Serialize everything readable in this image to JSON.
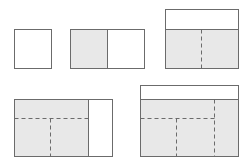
{
  "diagram": {
    "title": "",
    "colors": {
      "background": "#ffffff",
      "stroke": "#6b6b6b",
      "fill_shaded": "#e8e8e8",
      "fill_empty": "#ffffff",
      "dash_stroke": "#6b6b6b"
    },
    "figures": [
      {
        "id": "step-1",
        "outer": {
          "x": 14,
          "y": 29,
          "w": 37,
          "h": 39
        },
        "shaded": [],
        "solid_lines": [],
        "dashed_lines": []
      },
      {
        "id": "step-2",
        "outer": {
          "x": 70,
          "y": 29,
          "w": 74,
          "h": 39
        },
        "shaded": [
          {
            "x": 70,
            "y": 29,
            "w": 37,
            "h": 39
          }
        ],
        "solid_lines": [
          [
            107,
            29,
            107,
            68
          ]
        ],
        "dashed_lines": []
      },
      {
        "id": "step-3",
        "outer": {
          "x": 165,
          "y": 9,
          "w": 73,
          "h": 59
        },
        "shaded": [
          {
            "x": 165,
            "y": 29,
            "w": 73,
            "h": 39
          }
        ],
        "solid_lines": [
          [
            165,
            29,
            238,
            29
          ]
        ],
        "dashed_lines": [
          [
            201,
            29,
            201,
            68
          ]
        ]
      },
      {
        "id": "step-4",
        "outer": {
          "x": 14,
          "y": 99,
          "w": 98,
          "h": 57
        },
        "shaded": [
          {
            "x": 14,
            "y": 99,
            "w": 74,
            "h": 57
          }
        ],
        "solid_lines": [
          [
            88,
            99,
            88,
            156
          ]
        ],
        "dashed_lines": [
          [
            14,
            118,
            88,
            118
          ],
          [
            50,
            118,
            50,
            156
          ]
        ]
      },
      {
        "id": "step-5",
        "outer": {
          "x": 140,
          "y": 85,
          "w": 98,
          "h": 71
        },
        "shaded": [
          {
            "x": 140,
            "y": 99,
            "w": 98,
            "h": 57
          }
        ],
        "solid_lines": [
          [
            140,
            99,
            238,
            99
          ]
        ],
        "dashed_lines": [
          [
            214,
            99,
            214,
            156
          ],
          [
            140,
            118,
            214,
            118
          ],
          [
            176,
            118,
            176,
            156
          ]
        ]
      }
    ]
  }
}
